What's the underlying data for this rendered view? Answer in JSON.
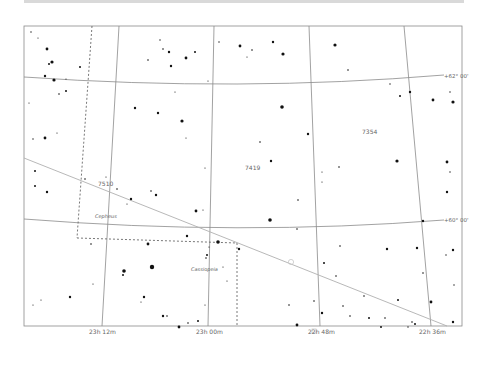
{
  "map": {
    "type": "star-chart",
    "frame": {
      "x": 24,
      "y": 26,
      "width": 438,
      "height": 300
    },
    "ra_labels": [
      {
        "text": "23h 12m",
        "x": 103
      },
      {
        "text": "23h 00m",
        "x": 208
      },
      {
        "text": "22h 48m",
        "x": 320
      },
      {
        "text": "22h 36m",
        "x": 433
      }
    ],
    "dec_labels": [
      {
        "text": "+62° 00'",
        "x": 444,
        "y": 78
      },
      {
        "text": "+60° 00'",
        "x": 444,
        "y": 222
      }
    ],
    "region_labels": [
      {
        "text": "7510",
        "x": 98,
        "y": 186
      },
      {
        "text": "7419",
        "x": 245,
        "y": 170
      },
      {
        "text": "7354",
        "x": 362,
        "y": 134
      }
    ],
    "constellation_labels": [
      {
        "text": "Cepheus",
        "x": 95,
        "y": 218
      },
      {
        "text": "Cassiopeia",
        "x": 191,
        "y": 271
      }
    ],
    "colors": {
      "grid": "#8a8a8a",
      "boundary": "#555555",
      "ecliptic": "#b0b0b0",
      "star": "#111111",
      "label": "#666666",
      "topbar": "#d9d9d9"
    }
  }
}
